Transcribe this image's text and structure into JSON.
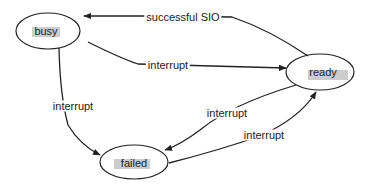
{
  "diagram": {
    "type": "state-transition",
    "nodes": [
      {
        "id": "busy",
        "label": "busy",
        "cx": 48,
        "cy": 31,
        "rx": 32,
        "ry": 18
      },
      {
        "id": "ready",
        "label": "ready",
        "cx": 320,
        "cy": 72,
        "rx": 34,
        "ry": 18
      },
      {
        "id": "failed",
        "label": "failed",
        "cx": 134,
        "cy": 162,
        "rx": 34,
        "ry": 17
      }
    ],
    "edges": [
      {
        "from": "ready",
        "to": "busy",
        "label": "successful SIO"
      },
      {
        "from": "busy",
        "to": "ready",
        "label": "interrupt"
      },
      {
        "from": "busy",
        "to": "failed",
        "label": "interrupt"
      },
      {
        "from": "ready",
        "to": "failed",
        "label": "interrupt"
      },
      {
        "from": "failed",
        "to": "ready",
        "label": "interrupt"
      }
    ],
    "colors": {
      "stroke": "#222222",
      "highlight": "#c4c4c4",
      "background": "#ffffff"
    }
  }
}
